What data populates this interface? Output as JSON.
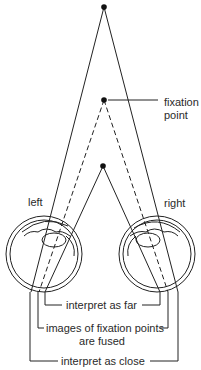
{
  "diagram": {
    "type": "binocular-disparity-illustration",
    "points": [
      {
        "id": "far-point",
        "x": 104,
        "y": 7
      },
      {
        "id": "fixation-point",
        "x": 104,
        "y": 100
      },
      {
        "id": "near-point",
        "x": 103,
        "y": 166
      }
    ],
    "eyes": [
      {
        "id": "left-eye",
        "label": "left",
        "cx": 44,
        "cy": 254,
        "r": 38
      },
      {
        "id": "right-eye",
        "label": "right",
        "cx": 157,
        "cy": 254,
        "r": 38
      }
    ],
    "colors": {
      "line": "#222222",
      "background": "#ffffff"
    }
  },
  "labels": {
    "fixation_line1": "fixation",
    "fixation_line2": "point",
    "left": "left",
    "right": "right",
    "interpret_far": "interpret as far",
    "fused_line1": "images of fixation points",
    "fused_line2": "are fused",
    "interpret_close": "interpret as close"
  }
}
